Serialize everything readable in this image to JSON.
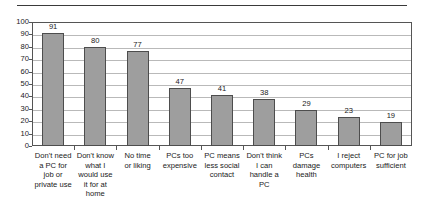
{
  "chart_data": {
    "type": "bar",
    "title": "",
    "subtitle": "",
    "xlabel": "",
    "ylabel": "",
    "ylim": [
      0,
      100
    ],
    "ytick_step": 10,
    "yticks": [
      "0",
      "10",
      "20",
      "30",
      "40",
      "50",
      "60",
      "70",
      "80",
      "90",
      "100"
    ],
    "grid": "horizontal",
    "legend": "none",
    "bar_color": "#9e9e9e",
    "bar_border_color": "#4d4d4d",
    "categories": [
      "Don't need a PC for job or private use",
      "Don't know what I would use it for at home",
      "No time or liking",
      "PCs too expensive",
      "PC means less social contact",
      "Don't think I can handle a PC",
      "PCs damage health",
      "I reject computers",
      "PC for job sufficient"
    ],
    "category_lines": [
      [
        "Don't need",
        "a PC for",
        "job or",
        "private use"
      ],
      [
        "Don't know",
        "what I",
        "would use",
        "it for at",
        "home"
      ],
      [
        "No time",
        "or liking"
      ],
      [
        "PCs too",
        "expensive"
      ],
      [
        "PC means",
        "less social",
        "contact"
      ],
      [
        "Don't think",
        "I can",
        "handle a",
        "PC"
      ],
      [
        "PCs",
        "damage",
        "health"
      ],
      [
        "I reject",
        "computers"
      ],
      [
        "PC for job",
        "sufficient"
      ]
    ],
    "values": [
      91,
      80,
      77,
      47,
      41,
      38,
      29,
      23,
      19
    ],
    "value_labels": [
      "91",
      "80",
      "77",
      "47",
      "41",
      "38",
      "29",
      "23",
      "19"
    ]
  }
}
